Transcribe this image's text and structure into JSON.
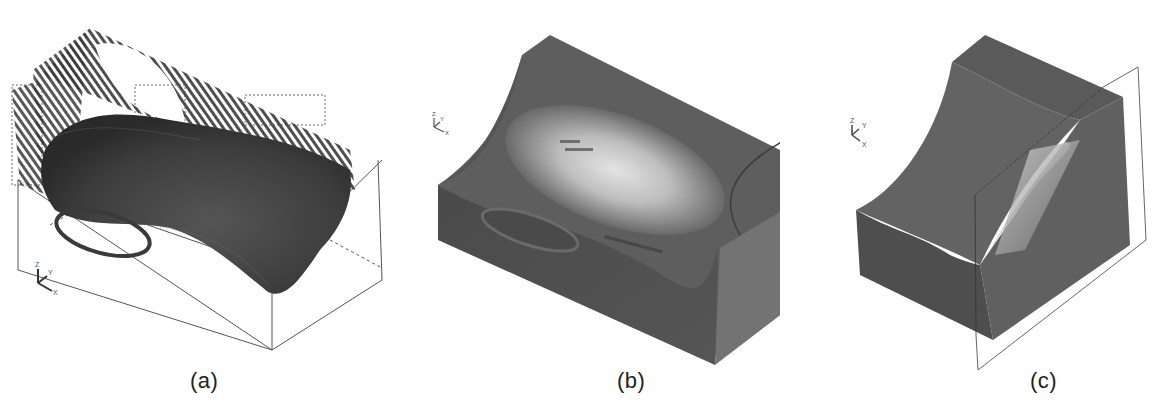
{
  "figure": {
    "panels": [
      {
        "id": "a",
        "caption": "(a)",
        "description": "Wireframe toolpath / vector field over sculpted cavity inside transparent bounding box, with highlighted elliptical region",
        "axis_triad": {
          "z": "Z",
          "y": "Y",
          "x": "X"
        }
      },
      {
        "id": "b",
        "caption": "(b)",
        "description": "Shaded solid block with concave saddle-shaped pocket and elliptical highlighted region",
        "axis_triad": {
          "z": "Z",
          "y": "Y",
          "x": "X"
        }
      },
      {
        "id": "c",
        "caption": "(c)",
        "description": "Shaded solid block section with concave surface cut by a sectioning plane outline",
        "axis_triad": {
          "z": "Z",
          "y": "Y",
          "x": "X"
        }
      }
    ],
    "colors": {
      "solid_dark": "#4a4a4a",
      "solid_mid": "#6b6b6b",
      "highlight": "#e8e8e8",
      "wire": "#333333",
      "outline": "#555555",
      "background": "#ffffff"
    }
  }
}
